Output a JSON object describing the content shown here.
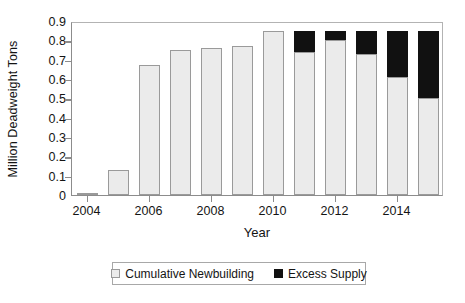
{
  "chart_data": {
    "type": "bar",
    "stacked": true,
    "title": "",
    "xlabel": "Year",
    "ylabel": "Million Deadweight Tons",
    "categories": [
      "2004",
      "2005",
      "2006",
      "2007",
      "2008",
      "2009",
      "2010",
      "2011",
      "2012",
      "2013",
      "2014",
      "2015"
    ],
    "series": [
      {
        "name": "Cumulative Newbuilding",
        "color": "#ebebeb",
        "values": [
          0.01,
          0.13,
          0.67,
          0.75,
          0.76,
          0.77,
          0.85,
          0.74,
          0.8,
          0.73,
          0.61,
          0.5
        ]
      },
      {
        "name": "Excess Supply",
        "color": "#111111",
        "values": [
          0,
          0,
          0,
          0,
          0,
          0,
          0,
          0.11,
          0.05,
          0.12,
          0.24,
          0.35
        ]
      }
    ],
    "ylim": [
      0,
      0.9
    ],
    "ytick_values": [
      0,
      0.1,
      0.2,
      0.3,
      0.4,
      0.5,
      0.6,
      0.7,
      0.8,
      0.9
    ],
    "ytick_labels": [
      "0",
      "0.1",
      "0.2",
      "0.3",
      "0.4",
      "0.5",
      "0.6",
      "0.7",
      "0.8",
      "0.9"
    ],
    "xtick_labels": [
      "2004",
      "2006",
      "2008",
      "2010",
      "2012",
      "2014"
    ],
    "grid": false,
    "legend_position": "bottom",
    "legend_entries": [
      "Cumulative Newbuilding",
      "Excess Supply"
    ]
  }
}
